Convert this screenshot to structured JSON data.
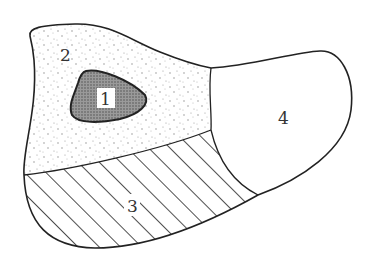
{
  "diagram": {
    "type": "region-map",
    "regions": [
      {
        "id": "1",
        "label": "1",
        "fill": "dark dotted (gray)",
        "color": "#7a7a7a",
        "label_style": "white box"
      },
      {
        "id": "2",
        "label": "2",
        "fill": "sparse stipple dots",
        "color": "#ffffff"
      },
      {
        "id": "3",
        "label": "3",
        "fill": "diagonal hatching",
        "color": "#ffffff"
      },
      {
        "id": "4",
        "label": "4",
        "fill": "blank",
        "color": "#ffffff"
      }
    ],
    "stroke_color": "#222222"
  }
}
